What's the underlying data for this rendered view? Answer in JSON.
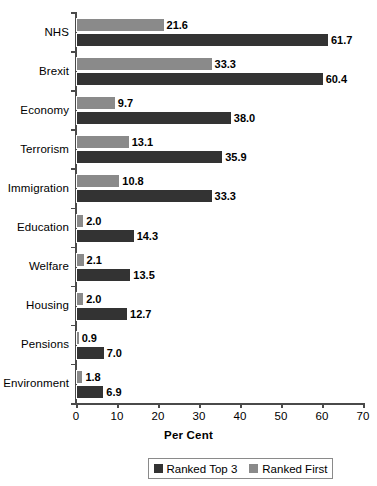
{
  "chart_data": {
    "type": "bar",
    "orientation": "horizontal",
    "title": "",
    "xlabel": "Per Cent",
    "ylabel": "",
    "xlim": [
      0,
      70
    ],
    "xticks": [
      0,
      10,
      20,
      30,
      40,
      50,
      60,
      70
    ],
    "grid": false,
    "legend_position": "bottom",
    "categories": [
      "NHS",
      "Brexit",
      "Economy",
      "Terrorism",
      "Immigration",
      "Education",
      "Welfare",
      "Housing",
      "Pensions",
      "Environment"
    ],
    "series": [
      {
        "name": "Ranked Top 3",
        "color": "#333333",
        "values": [
          61.7,
          60.4,
          38.0,
          35.9,
          33.3,
          14.3,
          13.5,
          12.7,
          7.0,
          6.9
        ],
        "labels": [
          "61.7",
          "60.4",
          "38.0",
          "35.9",
          "33.3",
          "14.3",
          "13.5",
          "12.7",
          "7.0",
          "6.9"
        ]
      },
      {
        "name": "Ranked First",
        "color": "#8a8a8a",
        "values": [
          21.6,
          33.3,
          9.7,
          13.1,
          10.8,
          2.0,
          2.1,
          2.0,
          0.9,
          1.8
        ],
        "labels": [
          "21.6",
          "33.3",
          "9.7",
          "13.1",
          "10.8",
          "2.0",
          "2.1",
          "2.0",
          "0.9",
          "1.8"
        ]
      }
    ]
  },
  "axis": {
    "x_title": "Per Cent",
    "tick_labels": [
      "0",
      "10",
      "20",
      "30",
      "40",
      "50",
      "60",
      "70"
    ]
  },
  "legend": {
    "entries": [
      {
        "label": "Ranked Top 3",
        "color": "#333333"
      },
      {
        "label": "Ranked First",
        "color": "#8a8a8a"
      }
    ]
  }
}
